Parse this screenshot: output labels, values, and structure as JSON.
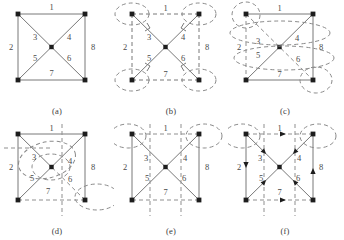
{
  "figure": {
    "title": "",
    "panel_count": 6,
    "grid": "2 rows x 3 columns",
    "background_color": "#ffffff",
    "line_color": "#777777",
    "text_color": "#4a4a4a",
    "vertex_color": "#222222"
  },
  "graph": {
    "description": "Square with both diagonals and a center vertex; eight numbered edges",
    "vertices": [
      "top-left",
      "top-right",
      "bottom-left",
      "bottom-right",
      "center"
    ],
    "edge_labels": [
      "1",
      "2",
      "3",
      "4",
      "5",
      "6",
      "7",
      "8"
    ],
    "edges": [
      {
        "label": "1",
        "from": "top-left",
        "to": "top-right",
        "position": "top side"
      },
      {
        "label": "2",
        "from": "top-left",
        "to": "bottom-left",
        "position": "left side"
      },
      {
        "label": "3",
        "from": "top-left",
        "to": "center",
        "position": "upper-left diagonal"
      },
      {
        "label": "4",
        "from": "top-right",
        "to": "center",
        "position": "upper-right diagonal"
      },
      {
        "label": "5",
        "from": "bottom-left",
        "to": "center",
        "position": "lower-left diagonal"
      },
      {
        "label": "6",
        "from": "bottom-right",
        "to": "center",
        "position": "lower-right diagonal"
      },
      {
        "label": "7",
        "from": "bottom-left",
        "to": "bottom-right",
        "position": "bottom side"
      },
      {
        "label": "8",
        "from": "top-right",
        "to": "bottom-right",
        "position": "right side"
      }
    ]
  },
  "panels": [
    {
      "id": "a",
      "caption": "(a)",
      "edge_labels": [
        "1",
        "2",
        "3",
        "4",
        "5",
        "6",
        "7",
        "8"
      ],
      "solid_edges": [
        "1",
        "2",
        "3",
        "4",
        "5",
        "6",
        "7",
        "8"
      ],
      "dashed_edges": [],
      "arrows": [],
      "ellipses": 0
    },
    {
      "id": "b",
      "caption": "(b)",
      "edge_labels": [
        "1",
        "2",
        "3",
        "4",
        "5",
        "6",
        "7",
        "8"
      ],
      "solid_edges": [
        "3",
        "4",
        "5",
        "6"
      ],
      "dashed_edges": [
        "1",
        "2",
        "7",
        "8"
      ],
      "arrows": [
        "3",
        "4",
        "5",
        "6"
      ],
      "ellipses": 4,
      "ellipse_targets": [
        "top-left",
        "top-right",
        "bottom-left",
        "bottom-right"
      ]
    },
    {
      "id": "c",
      "caption": "(c)",
      "edge_labels": [
        "1",
        "2",
        "3",
        "4",
        "5",
        "6",
        "7",
        "8"
      ],
      "solid_edges": [
        "1",
        "7",
        "4",
        "5",
        "8"
      ],
      "dashed_edges": [
        "2",
        "3",
        "6"
      ],
      "arrows": [],
      "ellipses": 4,
      "ellipse_targets": [
        "top-left",
        "bottom-right",
        "upper-band",
        "lower-band"
      ]
    },
    {
      "id": "d",
      "caption": "(d)",
      "edge_labels": [
        "1",
        "2",
        "3",
        "4",
        "5",
        "6",
        "7",
        "8"
      ],
      "solid_edges": [
        "1",
        "2",
        "8",
        "3",
        "5",
        "4"
      ],
      "dashed_edges": [
        "7",
        "6"
      ],
      "arrows": [],
      "ellipses": 3,
      "ellipse_targets": [
        "center",
        "bottom-right",
        "upper-left-band"
      ]
    },
    {
      "id": "e",
      "caption": "(e)",
      "edge_labels": [
        "1",
        "2",
        "3",
        "4",
        "5",
        "6",
        "7",
        "8"
      ],
      "solid_edges": [
        "2",
        "8",
        "3",
        "4",
        "5",
        "6"
      ],
      "dashed_edges": [
        "1",
        "7"
      ],
      "arrows": [],
      "ellipses": 2,
      "ellipse_targets": [
        "top-left",
        "top-right"
      ]
    },
    {
      "id": "f",
      "caption": "(f)",
      "edge_labels": [
        "1",
        "2",
        "3",
        "4",
        "5",
        "6",
        "7",
        "8"
      ],
      "solid_edges": [
        "2",
        "8",
        "3",
        "4",
        "5",
        "6"
      ],
      "dashed_edges": [
        "1",
        "7"
      ],
      "arrows": [
        "1",
        "2",
        "3",
        "4",
        "5",
        "6",
        "7",
        "8"
      ],
      "ellipses": 2,
      "ellipse_targets": [
        "top-left",
        "top-right"
      ]
    }
  ]
}
